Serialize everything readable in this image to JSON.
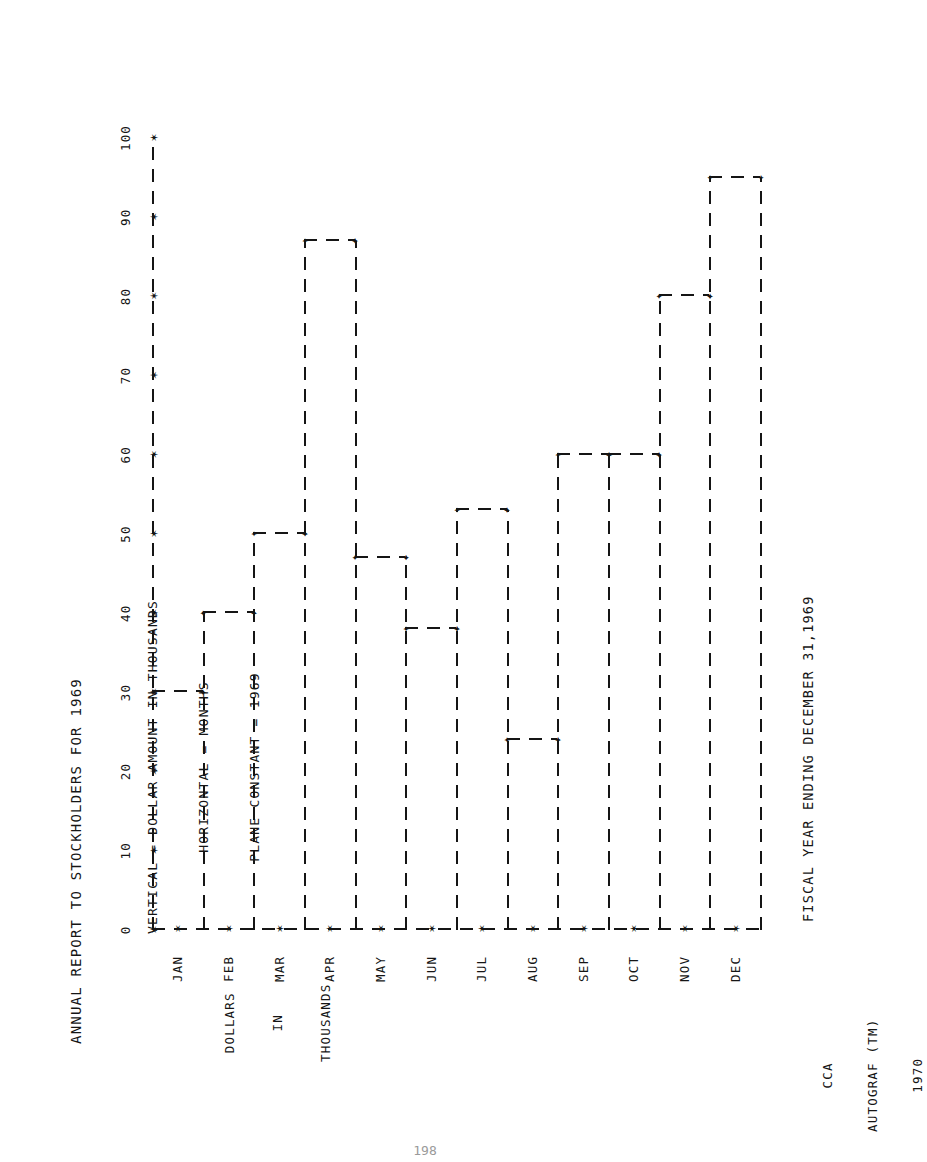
{
  "page": {
    "page_number": "198",
    "stamp_lines": [
      "CCA",
      "AUTOGRAF (TM)",
      "1970"
    ]
  },
  "title": "ANNUAL REPORT TO STOCKHOLDERS FOR 1969",
  "subtitle_lines": [
    "VERTICAL = DOLLAR AMOUNT IN THOUSANDS",
    "HORIZONTAL = MONTHS",
    "PLANE CONSTANT = 1969"
  ],
  "caption": "FISCAL YEAR ENDING DECEMBER 31,1969",
  "y_axis_caption_lines": [
    "DOLLARS",
    "IN",
    "THOUSANDS"
  ],
  "chart_data": {
    "type": "bar",
    "title": "ANNUAL REPORT TO STOCKHOLDERS FOR 1969",
    "subtitle": "VERTICAL = DOLLAR AMOUNT IN THOUSANDS / HORIZONTAL = MONTHS / PLANE CONSTANT = 1969",
    "xlabel": "MONTHS",
    "ylabel": "DOLLARS IN THOUSANDS",
    "categories": [
      "JAN",
      "FEB",
      "MAR",
      "APR",
      "MAY",
      "JUN",
      "JUL",
      "AUG",
      "SEP",
      "OCT",
      "NOV",
      "DEC"
    ],
    "values": [
      30,
      40,
      50,
      87,
      47,
      38,
      53,
      24,
      60,
      60,
      80,
      95
    ],
    "ylim": [
      0,
      100
    ],
    "yticks": [
      0,
      10,
      20,
      30,
      40,
      50,
      60,
      70,
      80,
      90,
      100
    ],
    "ytick_labels": [
      "0",
      "10",
      "20",
      "30",
      "40",
      "50",
      "60",
      "70",
      "80",
      "90",
      "100"
    ],
    "grid": false,
    "legend": null,
    "style": "dashed step outline, plotter pen"
  }
}
